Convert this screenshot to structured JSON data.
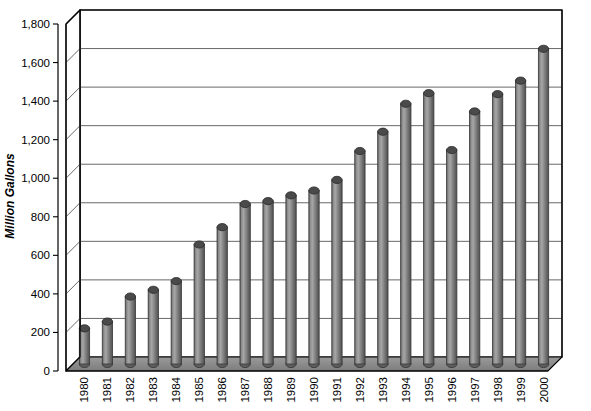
{
  "chart_data": {
    "type": "bar",
    "title": "",
    "subtitle": "",
    "xlabel": "",
    "ylabel": "Million Gallons",
    "ylim": [
      0,
      1800
    ],
    "ytick_labels": [
      "1,800",
      "1,600",
      "1,400",
      "1,200",
      "1,000",
      "800",
      "600",
      "400",
      "200",
      "0"
    ],
    "ytick_values": [
      1800,
      1600,
      1400,
      1200,
      1000,
      800,
      600,
      400,
      200,
      0
    ],
    "grid": true,
    "legend": "none",
    "style": "3d-cylinder",
    "categories": [
      "1980",
      "1981",
      "1982",
      "1983",
      "1984",
      "1985",
      "1986",
      "1987",
      "1988",
      "1989",
      "1990",
      "1991",
      "1992",
      "1993",
      "1994",
      "1995",
      "1996",
      "1997",
      "1998",
      "1999",
      "2000"
    ],
    "values": [
      185,
      220,
      350,
      385,
      430,
      620,
      710,
      830,
      845,
      875,
      900,
      955,
      1105,
      1205,
      1350,
      1405,
      1110,
      1310,
      1400,
      1470,
      1635
    ],
    "series": [
      {
        "name": "Million Gallons",
        "values": [
          185,
          220,
          350,
          385,
          430,
          620,
          710,
          830,
          845,
          875,
          900,
          955,
          1105,
          1205,
          1350,
          1405,
          1110,
          1310,
          1400,
          1470,
          1635
        ]
      }
    ]
  },
  "colors": {
    "bar_light": "#9a9a9a",
    "bar_mid": "#6e6e6e",
    "bar_dark": "#4a4a4a",
    "floor": "#8c8c8c",
    "grid": "#58585a",
    "frame": "#000000",
    "background": "#ffffff"
  },
  "axis": {
    "y_title": "Million Gallons"
  }
}
